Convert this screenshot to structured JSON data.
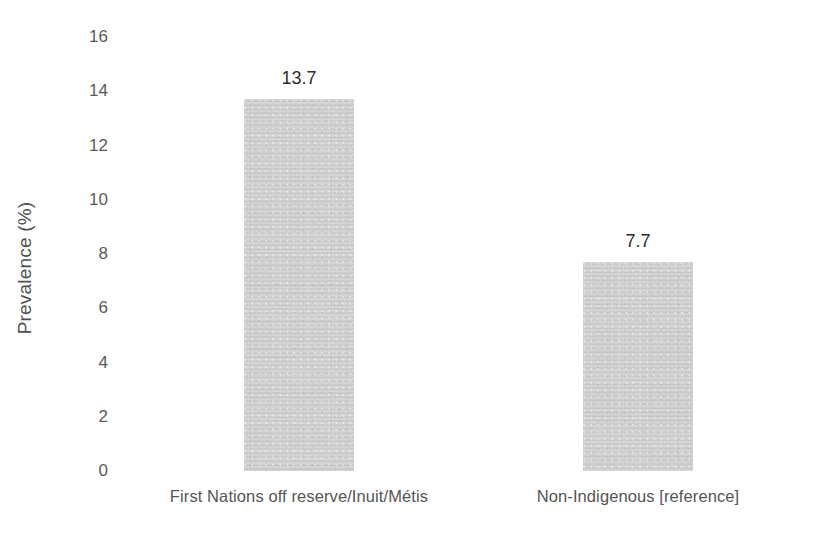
{
  "chart_data": {
    "type": "bar",
    "title": "",
    "subtitle": "",
    "xlabel": "",
    "ylabel": "Prevalence (%)",
    "categories": [
      "First Nations off reserve/Inuit/Métis",
      "Non-Indigenous [reference]"
    ],
    "values": [
      13.7,
      7.7
    ],
    "data_labels": [
      "13.7",
      "7.7"
    ],
    "ylim": [
      0,
      16
    ],
    "ytick_labels": [
      "0",
      "2",
      "4",
      "6",
      "8",
      "10",
      "12",
      "14",
      "16"
    ],
    "ytick_values": [
      0,
      2,
      4,
      6,
      8,
      10,
      12,
      14,
      16
    ],
    "grid": false,
    "legend": false,
    "legend_position": "none",
    "axis_lines": false,
    "tick_marks": false,
    "bar_color": "#c9c9c9",
    "background_color": "#ffffff",
    "text_color": "#555555",
    "value_label_color": "#2b2b2b"
  }
}
